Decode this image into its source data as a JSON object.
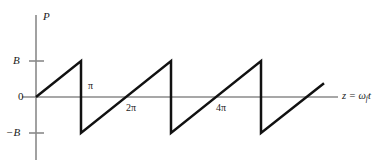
{
  "figure": {
    "kind": "sawtooth-waveform-plot",
    "background": "#ffffff",
    "axis_color": "#8a8a8a",
    "curve_color": "#111111",
    "text_color": "#1a1a1a"
  },
  "labels": {
    "y_axis_name": "P",
    "x_axis_name_prefix": "z = ",
    "x_axis_name_omega": "ω",
    "x_axis_name_sub": "f",
    "x_axis_name_t": "t",
    "y_tick_top": "B",
    "y_tick_zero": "0",
    "y_tick_bottom": "−B",
    "x_tick_pi": "π",
    "x_tick_2pi": "2π",
    "x_tick_4pi": "4π"
  },
  "chart_data": {
    "type": "line",
    "title": "",
    "xlabel": "z = ω_f t",
    "ylabel": "P",
    "grid": false,
    "legend": false,
    "xlim": [
      0,
      6.5
    ],
    "ylim": [
      -1.25,
      1.6
    ],
    "y_ticks": [
      {
        "value": 1,
        "label": "B"
      },
      {
        "value": 0,
        "label": "0"
      },
      {
        "value": -1,
        "label": "−B"
      }
    ],
    "x_ticks": [
      {
        "value": 1,
        "label": "π",
        "position": "above-axis"
      },
      {
        "value": 2,
        "label": "2π",
        "position": "below-axis"
      },
      {
        "value": 4,
        "label": "4π",
        "position": "below-axis"
      }
    ],
    "series": [
      {
        "name": "sawtooth",
        "waveform": "sawtooth",
        "amplitude": "B",
        "period_in_pi": 2,
        "points": [
          [
            0,
            0
          ],
          [
            1,
            1
          ],
          [
            1,
            -1
          ],
          [
            3,
            1
          ],
          [
            3,
            -1
          ],
          [
            5,
            1
          ],
          [
            5,
            -1
          ],
          [
            6.4,
            0.38
          ]
        ]
      }
    ]
  },
  "geometry": {
    "origin_x": 36,
    "origin_y": 97,
    "y_top_px": 61,
    "y_bottom_px": 133,
    "x_axis_end": 338,
    "y_axis_top": 15,
    "y_axis_bottom": 160,
    "drops_px": [
      82,
      172,
      262
    ],
    "ramp_end_x": 325,
    "ramp_end_y": 70
  }
}
